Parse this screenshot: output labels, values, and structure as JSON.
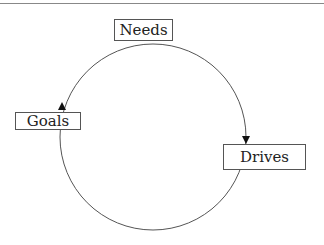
{
  "diagram": {
    "type": "cycle",
    "nodes": [
      {
        "id": "needs",
        "label": "Needs"
      },
      {
        "id": "drives",
        "label": "Drives"
      },
      {
        "id": "goals",
        "label": "Goals"
      }
    ],
    "edges": [
      {
        "from": "needs",
        "to": "drives"
      },
      {
        "from": "drives",
        "to": "goals"
      },
      {
        "from": "goals",
        "to": "needs"
      }
    ]
  }
}
